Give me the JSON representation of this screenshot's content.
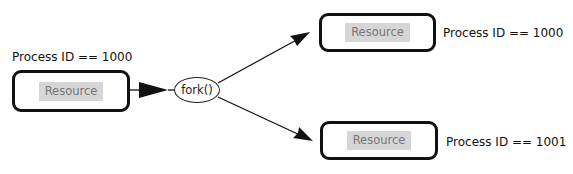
{
  "diagram": {
    "type": "process-fork",
    "parent": {
      "label": "Process ID == 1000",
      "resource": "Resource"
    },
    "operation": {
      "label": "fork()"
    },
    "children": [
      {
        "label": "Process ID == 1000",
        "resource": "Resource",
        "role": "parent-after-fork"
      },
      {
        "label": "Process ID == 1001",
        "resource": "Resource",
        "role": "child"
      }
    ],
    "edges": [
      {
        "from": "parent",
        "to": "fork",
        "style": "thick-filled-arrow"
      },
      {
        "from": "fork",
        "to": "children.0",
        "style": "arrow"
      },
      {
        "from": "fork",
        "to": "children.1",
        "style": "arrow"
      }
    ],
    "colors": {
      "stroke": "#111111",
      "resource_fill": "#d6d6d6",
      "resource_text": "#777777",
      "background": "#ffffff"
    }
  }
}
